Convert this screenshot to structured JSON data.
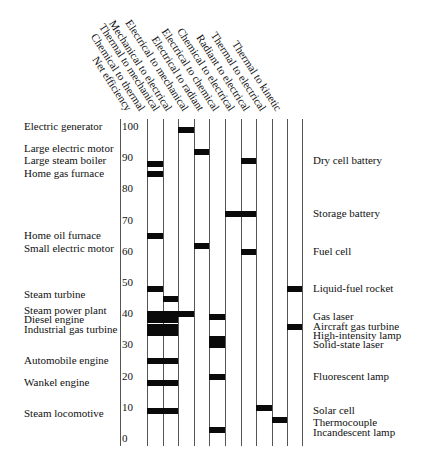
{
  "chart_data": {
    "type": "table",
    "title": "",
    "ylabel": "Net efficiency",
    "ylim": [
      0,
      100
    ],
    "y_ticks": [
      100,
      90,
      80,
      70,
      60,
      50,
      40,
      30,
      20,
      10,
      0
    ],
    "columns": [
      "Net efficiency",
      "Chemical to thermal",
      "Thermal to mechanical",
      "Mechanical to electrical",
      "Electrical to mechanical",
      "Electrical to radiant",
      "Electrical to chemical",
      "Chemical to electrical",
      "Radiant to electrical",
      "Thermal to electrical",
      "Thermal to kinetic"
    ],
    "conversion_columns": [
      "Chemical to thermal",
      "Thermal to mechanical",
      "Mechanical to electrical",
      "Electrical to mechanical",
      "Electrical to radiant",
      "Electrical to chemical",
      "Chemical to electrical",
      "Radiant to electrical",
      "Thermal to electrical",
      "Thermal to kinetic"
    ],
    "left_labels": [
      {
        "text": "Electric generator",
        "y_value": 100
      },
      {
        "text": "Large electric motor",
        "y_value": 93
      },
      {
        "text": "Large steam boiler",
        "y_value": 89
      },
      {
        "text": "Home gas furnace",
        "y_value": 85
      },
      {
        "text": "Home oil furnace",
        "y_value": 65
      },
      {
        "text": "Small electric motor",
        "y_value": 61
      },
      {
        "text": "Steam turbine",
        "y_value": 46
      },
      {
        "text": "Steam power plant",
        "y_value": 41
      },
      {
        "text": "Diesel engine",
        "y_value": 38
      },
      {
        "text": "Industrial gas turbine",
        "y_value": 35
      },
      {
        "text": "Automobile engine",
        "y_value": 25
      },
      {
        "text": "Wankel engine",
        "y_value": 18
      },
      {
        "text": "Steam locomotive",
        "y_value": 8
      }
    ],
    "right_labels": [
      {
        "text": "Dry cell battery",
        "y_value": 89
      },
      {
        "text": "Storage battery",
        "y_value": 72
      },
      {
        "text": "Fuel cell",
        "y_value": 60
      },
      {
        "text": "Liquid-fuel rocket",
        "y_value": 48
      },
      {
        "text": "Gas laser",
        "y_value": 39
      },
      {
        "text": "Aircraft gas turbine",
        "y_value": 36
      },
      {
        "text": "High-intensity lamp",
        "y_value": 33
      },
      {
        "text": "Solid-state laser",
        "y_value": 30
      },
      {
        "text": "Fluorescent lamp",
        "y_value": 20
      },
      {
        "text": "Solar cell",
        "y_value": 9
      },
      {
        "text": "Thermocouple",
        "y_value": 5
      },
      {
        "text": "Incandescent lamp",
        "y_value": 2
      }
    ],
    "bars": [
      {
        "device": "Electric generator",
        "value": 99,
        "col_start": 2,
        "col_end": 3
      },
      {
        "device": "Large electric motor",
        "value": 92,
        "col_start": 3,
        "col_end": 4
      },
      {
        "device": "Large steam boiler",
        "value": 88,
        "col_start": 0,
        "col_end": 1
      },
      {
        "device": "Dry cell battery",
        "value": 89,
        "col_start": 6,
        "col_end": 7
      },
      {
        "device": "Home gas furnace",
        "value": 85,
        "col_start": 0,
        "col_end": 1
      },
      {
        "device": "Storage battery",
        "value": 72,
        "col_start": 5,
        "col_end": 7
      },
      {
        "device": "Home oil furnace",
        "value": 65,
        "col_start": 0,
        "col_end": 1
      },
      {
        "device": "Small electric motor",
        "value": 62,
        "col_start": 3,
        "col_end": 4
      },
      {
        "device": "Fuel cell",
        "value": 60,
        "col_start": 6,
        "col_end": 7
      },
      {
        "device": "Steam turbine",
        "value": 48,
        "col_start": 0,
        "col_end": 1
      },
      {
        "device": "Liquid-fuel rocket",
        "value": 48,
        "col_start": 9,
        "col_end": 10
      },
      {
        "device": "Steam turbine (mechanical)",
        "value": 45,
        "col_start": 1,
        "col_end": 2
      },
      {
        "device": "Steam power plant",
        "value": 40,
        "col_start": 0,
        "col_end": 3
      },
      {
        "device": "Gas laser",
        "value": 39,
        "col_start": 4,
        "col_end": 5
      },
      {
        "device": "Diesel engine",
        "value": 38,
        "col_start": 0,
        "col_end": 2
      },
      {
        "device": "Industrial gas turbine",
        "value": 36,
        "col_start": 0,
        "col_end": 2
      },
      {
        "device": "Aircraft gas turbine",
        "value": 36,
        "col_start": 9,
        "col_end": 10
      },
      {
        "device": "Industrial gas turbine (2)",
        "value": 34,
        "col_start": 0,
        "col_end": 2
      },
      {
        "device": "High-intensity lamp",
        "value": 32,
        "col_start": 4,
        "col_end": 5
      },
      {
        "device": "Solid-state laser",
        "value": 30,
        "col_start": 4,
        "col_end": 5
      },
      {
        "device": "Automobile engine",
        "value": 25,
        "col_start": 0,
        "col_end": 2
      },
      {
        "device": "Fluorescent lamp",
        "value": 20,
        "col_start": 4,
        "col_end": 5
      },
      {
        "device": "Wankel engine",
        "value": 18,
        "col_start": 0,
        "col_end": 2
      },
      {
        "device": "Solar cell",
        "value": 10,
        "col_start": 7,
        "col_end": 8
      },
      {
        "device": "Steam locomotive",
        "value": 9,
        "col_start": 0,
        "col_end": 2
      },
      {
        "device": "Thermocouple",
        "value": 6,
        "col_start": 8,
        "col_end": 9
      },
      {
        "device": "Incandescent lamp",
        "value": 3,
        "col_start": 4,
        "col_end": 5
      }
    ],
    "grid": true,
    "legend_position": "none"
  }
}
